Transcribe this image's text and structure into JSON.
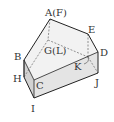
{
  "diagram": {
    "type": "3d-solid",
    "vertices": {
      "apex": "A(F)",
      "e": "E",
      "d": "D",
      "j": "J",
      "b": "B",
      "h": "H",
      "c": "C",
      "i": "I",
      "g": "G(L)",
      "k": "K"
    },
    "colors": {
      "edge": "#222222",
      "hidden_edge": "#777777",
      "top_face": "#f2f2f2",
      "front_face": "#e4e4e4",
      "side_face": "#d2d2d2"
    }
  }
}
